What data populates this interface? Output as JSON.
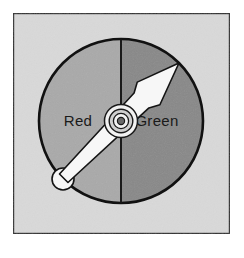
{
  "figure": {
    "kind": "two-color-dial-gauge",
    "canvas": {
      "width": 244,
      "height": 258
    },
    "panel": {
      "name": "figure-panel",
      "fill": "#d9d9d9",
      "border_color": "#2b2b2b",
      "x": 13,
      "y": 13,
      "width": 217,
      "height": 221
    },
    "dial": {
      "center_x": 121,
      "center_y": 121,
      "radius": 82,
      "outline_color": "#111111",
      "outline_width": 2.5,
      "divider_color": "#1a1a1a",
      "divider_width": 2
    },
    "sectors": [
      {
        "name": "red-sector",
        "label": "Red",
        "fill": "#a9a9a9",
        "side": "left",
        "label_x": 78,
        "label_y": 126
      },
      {
        "name": "green-sector",
        "label": "Green",
        "fill": "#888888",
        "side": "right",
        "label_x": 155,
        "label_y": 126
      }
    ],
    "needle": {
      "name": "dial-needle",
      "fill": "#f7f7f7",
      "stroke": "#141414",
      "stroke_width": 1.6,
      "angle_degrees": 45,
      "points_toward": "Green",
      "tip_x": 192,
      "tip_y": 60,
      "tail_x": 62,
      "tail_y": 180,
      "tail_bulb_radius": 11
    },
    "hub": {
      "name": "needle-hub",
      "rings": [
        {
          "r": 17,
          "fill": "#f2f2f2",
          "stroke": "#1a1a1a"
        },
        {
          "r": 12,
          "fill": "#d0d0d0",
          "stroke": "#1a1a1a"
        },
        {
          "r": 8,
          "fill": "#f2f2f2",
          "stroke": "#1a1a1a"
        },
        {
          "r": 4,
          "fill": "#6a6a6a",
          "stroke": "#1a1a1a"
        }
      ]
    }
  }
}
